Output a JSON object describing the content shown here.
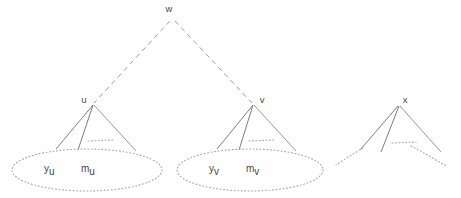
{
  "diagram": {
    "background_color": "#ffffff",
    "line_color": "#6d6d76",
    "dashed_edge_color": "#8e8e96",
    "dotted_shape_color": "#a9a9b0",
    "text_color": "#46464e",
    "nodes": [
      {
        "id": "w",
        "label": "w",
        "x": 172,
        "y": 12
      },
      {
        "id": "u",
        "label": "u",
        "x": 84,
        "y": 103
      },
      {
        "id": "v",
        "label": "v",
        "x": 262,
        "y": 103
      },
      {
        "id": "x",
        "label": "x",
        "x": 404,
        "y": 103
      }
    ],
    "set_labels": [
      {
        "id": "y_u",
        "base": "y",
        "sub": "u",
        "x": 47,
        "y": 172
      },
      {
        "id": "m_u",
        "base": "m",
        "sub": "u",
        "x": 85,
        "y": 172
      },
      {
        "id": "y_v",
        "base": "y",
        "sub": "v",
        "x": 212,
        "y": 172
      },
      {
        "id": "m_v",
        "base": "m",
        "sub": "v",
        "x": 250,
        "y": 172
      }
    ],
    "dashed_edges": [
      {
        "id": "w-u",
        "from": "w",
        "to": "u"
      },
      {
        "id": "w-v",
        "from": "w",
        "to": "v"
      }
    ],
    "cones": [
      {
        "id": "cone-u",
        "apex": "u",
        "children": 3,
        "has_ellipsis": true,
        "has_ellipse": true
      },
      {
        "id": "cone-v",
        "apex": "v",
        "children": 3,
        "has_ellipsis": true,
        "has_ellipse": true
      },
      {
        "id": "cone-x",
        "apex": "x",
        "children": 3,
        "has_ellipsis": true,
        "has_ellipse": false
      }
    ],
    "ellipses": [
      {
        "id": "ellipse-u",
        "cx": 87,
        "cy": 170,
        "rx": 75,
        "ry": 21
      },
      {
        "id": "ellipse-v",
        "cx": 250,
        "cy": 170,
        "rx": 73,
        "ry": 21
      }
    ]
  }
}
